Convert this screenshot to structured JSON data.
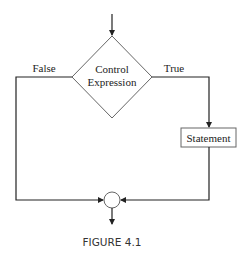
{
  "diagram": {
    "type": "flowchart",
    "decision": {
      "line1": "Control",
      "line2": "Expression"
    },
    "branches": {
      "false_label": "False",
      "true_label": "True"
    },
    "statement_label": "Statement",
    "caption": "FIGURE 4.1",
    "colors": {
      "line": "#222222",
      "background": "#ffffff"
    }
  }
}
